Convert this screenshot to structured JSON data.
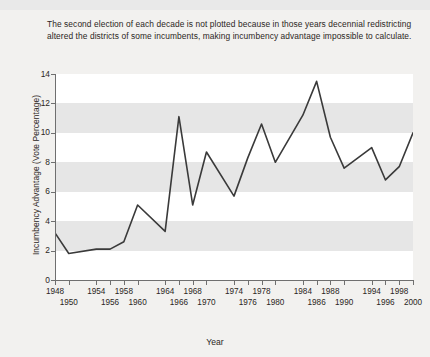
{
  "caption": "The second election of each decade is not plotted because in those years decennial redistricting altered the districts of some incumbents, making incumbency advantage impossible to calculate.",
  "chart_data": {
    "type": "line",
    "title": "",
    "xlabel": "Year",
    "ylabel": "Incumbency Advantage (Vote Percentage)",
    "xlim": [
      1948,
      2000
    ],
    "ylim": [
      0,
      14
    ],
    "ytick_labels": [
      "0",
      "2",
      "4",
      "6",
      "8",
      "10",
      "12",
      "14"
    ],
    "yticks": [
      0,
      2,
      4,
      6,
      8,
      10,
      12,
      14
    ],
    "xticks_row1": [
      "1948",
      "1954",
      "1958",
      "1964",
      "1968",
      "1974",
      "1978",
      "1984",
      "1988",
      "1994",
      "1998"
    ],
    "xticks_row2": [
      "1950",
      "1956",
      "1960",
      "1966",
      "1970",
      "1976",
      "1980",
      "1986",
      "1990",
      "1996",
      "2000"
    ],
    "xticks_all": [
      1948,
      1950,
      1954,
      1956,
      1958,
      1960,
      1964,
      1966,
      1968,
      1970,
      1974,
      1976,
      1978,
      1980,
      1984,
      1986,
      1988,
      1990,
      1994,
      1996,
      1998,
      2000
    ],
    "grid": "horizontal-bands",
    "legend": "none",
    "line_color": "#3a3a3a",
    "series": [
      {
        "name": "Incumbency Advantage",
        "x": [
          1948,
          1950,
          1954,
          1956,
          1958,
          1960,
          1964,
          1966,
          1968,
          1970,
          1974,
          1976,
          1978,
          1980,
          1984,
          1986,
          1988,
          1990,
          1994,
          1996,
          1998,
          2000
        ],
        "values": [
          3.2,
          1.8,
          2.1,
          2.1,
          2.6,
          5.1,
          3.3,
          11.1,
          5.1,
          8.7,
          5.7,
          8.3,
          10.6,
          8.0,
          11.2,
          13.5,
          9.7,
          7.6,
          9.0,
          6.8,
          7.7,
          10.0
        ]
      }
    ]
  }
}
